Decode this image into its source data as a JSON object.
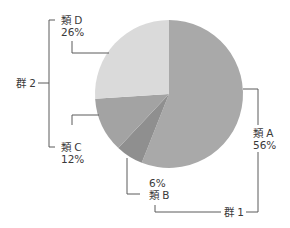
{
  "chart_data": {
    "type": "pie",
    "title": "",
    "start_angle_deg": 0,
    "direction": "clockwise",
    "categories": [
      "類 A",
      "類 B",
      "類 C",
      "類 D"
    ],
    "values": [
      56,
      6,
      12,
      26
    ],
    "value_labels": [
      "56%",
      "6%",
      "12%",
      "26%"
    ],
    "colors": [
      "#a9a9a9",
      "#8f8f8f",
      "#a3a3a3",
      "#dadada"
    ],
    "groups": [
      {
        "name": "群 1",
        "members": [
          "類 A",
          "類 B"
        ]
      },
      {
        "name": "群 2",
        "members": [
          "類 C",
          "類 D"
        ]
      }
    ],
    "legend": "none (direct labels with leader lines)"
  },
  "labels": {
    "a_name": "類 A",
    "a_pct": "56%",
    "b_name": "類 B",
    "b_pct": "6%",
    "c_name": "類 C",
    "c_pct": "12%",
    "d_name": "類 D",
    "d_pct": "26%",
    "group1": "群 1",
    "group2": "群 2"
  }
}
